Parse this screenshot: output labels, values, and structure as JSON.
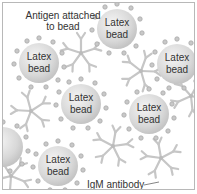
{
  "diagram": {
    "title_label": "Antigen attached to bead",
    "title_lines": [
      "Antigen attached",
      "to bead"
    ],
    "bead_label_line1": "Latex",
    "bead_label_line2": "bead",
    "antibody_label": "IgM antibody",
    "colors": {
      "bead_fill": "#d9d9d9",
      "antigen_dot": "#b5b5b5",
      "antibody": "#c4c4c4",
      "text": "#333333",
      "border": "#b8b8b8"
    },
    "beads": [
      {
        "id": 1,
        "label": "Latex bead",
        "cx": 38,
        "cy": 62
      },
      {
        "id": 2,
        "label": "Latex bead",
        "cx": 116,
        "cy": 28
      },
      {
        "id": 3,
        "label": "Latex bead",
        "cx": 176,
        "cy": 63
      },
      {
        "id": 4,
        "label": "Latex bead",
        "cx": 80,
        "cy": 103
      },
      {
        "id": 5,
        "label": "Latex bead",
        "cx": 148,
        "cy": 113
      },
      {
        "id": 6,
        "label": "Latex bead",
        "cx": 57,
        "cy": 165
      },
      {
        "id": 7,
        "label": "",
        "cx": 2,
        "cy": 146
      }
    ]
  }
}
